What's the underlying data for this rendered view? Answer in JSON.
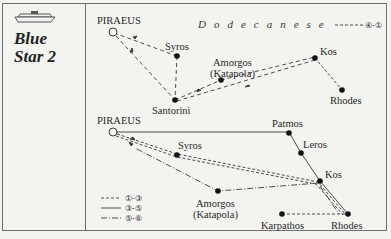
{
  "ship": {
    "name_line1": "Blue",
    "name_line2": "Star 2",
    "icon": "ferry-ship-icon"
  },
  "top_map": {
    "region_label": "Dodecanese",
    "legend": {
      "style": "dashed",
      "label": "④-①"
    },
    "ports": [
      {
        "name": "PIRAEUS",
        "type": "origin"
      },
      {
        "name": "Syros",
        "type": "stop"
      },
      {
        "name": "Amorgos",
        "sub": "(Katapola)",
        "type": "stop"
      },
      {
        "name": "Santorini",
        "type": "stop"
      },
      {
        "name": "Kos",
        "type": "stop"
      },
      {
        "name": "Rhodes",
        "type": "stop"
      }
    ]
  },
  "bottom_map": {
    "ports": [
      {
        "name": "PIRAEUS",
        "type": "origin"
      },
      {
        "name": "Patmos",
        "type": "stop"
      },
      {
        "name": "Leros",
        "type": "stop"
      },
      {
        "name": "Kos",
        "type": "stop"
      },
      {
        "name": "Syros",
        "type": "stop"
      },
      {
        "name": "Amorgos",
        "sub": "(Katapola)",
        "type": "stop"
      },
      {
        "name": "Karpathos",
        "type": "stop"
      },
      {
        "name": "Rhodes",
        "type": "stop"
      }
    ],
    "legend": [
      {
        "style": "dashed",
        "label": "①-③"
      },
      {
        "style": "solid",
        "label": "③-⑤"
      },
      {
        "style": "dash-dot",
        "label": "⑤-⑥"
      }
    ]
  },
  "colors": {
    "background": "#f3f3f0",
    "line": "#3a3a3a",
    "border": "#6f6f6f"
  }
}
